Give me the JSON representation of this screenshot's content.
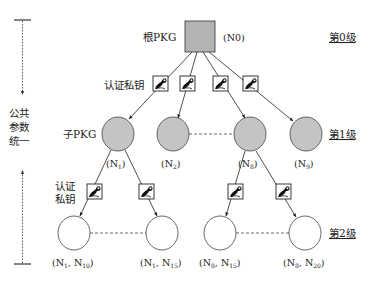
{
  "diagram": {
    "side_label": [
      "公共",
      "参数",
      "统一"
    ],
    "root": {
      "label": "根PKG",
      "id": "(N0)"
    },
    "child_label": "子PKG",
    "auth_key_label_top": "认证私钥",
    "auth_key_label_bottom": [
      "认证",
      "私钥"
    ],
    "levels": [
      "第0级",
      "第1级",
      "第2级"
    ],
    "level1_nodes": [
      {
        "name": "N",
        "sub": "1"
      },
      {
        "name": "N",
        "sub": "2"
      },
      {
        "name": "N",
        "sub": "8"
      },
      {
        "name": "N",
        "sub": "9"
      }
    ],
    "level2_nodes": [
      {
        "parent": "N",
        "parent_sub": "1",
        "name": "N",
        "sub": "10"
      },
      {
        "parent": "N",
        "parent_sub": "1",
        "name": "N",
        "sub": "15"
      },
      {
        "parent": "N",
        "parent_sub": "8",
        "name": "N",
        "sub": "15"
      },
      {
        "parent": "N",
        "parent_sub": "8",
        "name": "N",
        "sub": "20"
      }
    ],
    "colors": {
      "root_fill": "#b3b3b3",
      "level1_fill": "#c4c4c4",
      "stroke": "#333333"
    }
  }
}
